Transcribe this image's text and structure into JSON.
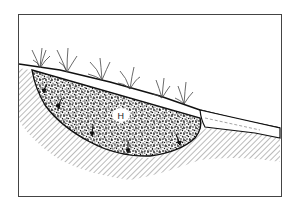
{
  "diagram": {
    "frame": {
      "x": 18,
      "y": 14,
      "width": 263,
      "height": 182
    },
    "colors": {
      "line": "#1a1a1a",
      "hatch": "#555555",
      "background": "#ffffff"
    },
    "labels": {
      "center": "H"
    },
    "elements": [
      {
        "id": "ground-surface",
        "description": "sloping ground surface line from upper-left to lower-right"
      },
      {
        "id": "gravel-trench",
        "description": "lens-shaped stipple-filled trench below surface"
      },
      {
        "id": "grass-tufts",
        "count": 6,
        "description": "grass plants along the surface"
      },
      {
        "id": "outflow-pipe",
        "description": "tapered outlet channel on right side"
      },
      {
        "id": "subsoil-hatch",
        "description": "diagonal hatching indicating undisturbed subsoil"
      },
      {
        "id": "infiltration-arrows",
        "count": 5,
        "description": "small downward arrows at trench boundary"
      }
    ]
  }
}
